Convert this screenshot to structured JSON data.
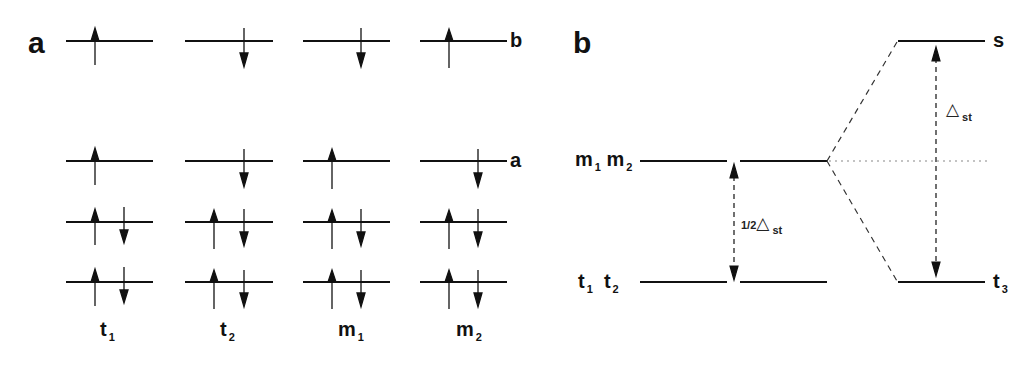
{
  "panel_a": {
    "label": "a",
    "level_labels": {
      "b": "b",
      "a": "a"
    },
    "columns": [
      {
        "name": "t",
        "sub": "1",
        "levels": {
          "b": "up",
          "a": "up",
          "l2": "up-down",
          "l1": "up-down"
        }
      },
      {
        "name": "t",
        "sub": "2",
        "levels": {
          "b": "down",
          "a": "down",
          "l2": "up-down",
          "l1": "up-down"
        }
      },
      {
        "name": "m",
        "sub": "1",
        "levels": {
          "b": "down",
          "a": "up",
          "l2": "up-down",
          "l1": "up-down"
        }
      },
      {
        "name": "m",
        "sub": "2",
        "levels": {
          "b": "up",
          "a": "down",
          "l2": "up-down",
          "l1": "up-down"
        }
      }
    ]
  },
  "panel_b": {
    "label": "b",
    "left_upper": {
      "m1": "m",
      "m1_sub": "1",
      "m2": "m",
      "m2_sub": "2"
    },
    "left_lower": {
      "t1": "t",
      "t1_sub": "1",
      "t2": "t",
      "t2_sub": "2"
    },
    "right_upper": {
      "label": "s"
    },
    "right_lower": {
      "label": "t",
      "sub": "3"
    },
    "half_gap": {
      "prefix": "1/2",
      "symbol": "△",
      "sub": "st"
    },
    "full_gap": {
      "symbol": "△",
      "sub": "st"
    }
  },
  "colors": {
    "line": "#111111",
    "dotted": "#888888",
    "text": "#111111"
  }
}
